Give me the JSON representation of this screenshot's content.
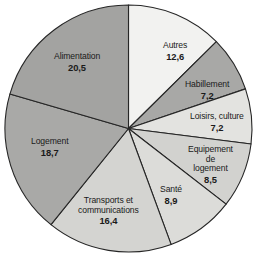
{
  "chart_data": {
    "type": "pie",
    "title": "",
    "subtitle": "",
    "xlabel": "",
    "ylabel": "",
    "grid": false,
    "legend_position": "none",
    "label_format": "name + value inside slice",
    "decimal_separator": ",",
    "total": 100,
    "start_angle_deg": 0,
    "direction": "clockwise",
    "categories": [
      "Autres",
      "Habillement",
      "Loisirs, culture",
      "Equipement de logement",
      "Santé",
      "Transports et communications",
      "Logement",
      "Alimentation"
    ],
    "values": [
      12.6,
      7.2,
      7.2,
      8.5,
      8.9,
      16.4,
      18.7,
      20.5
    ],
    "slices": [
      {
        "name": "Autres",
        "label_lines": [
          "Autres"
        ],
        "value": 12.6,
        "value_text": "12,6",
        "color": "#f2f2f0",
        "start_deg": 0,
        "end_deg": 45.36
      },
      {
        "name": "Habillement",
        "label_lines": [
          "Habillement"
        ],
        "value": 7.2,
        "value_text": "7,2",
        "color": "#a8a8a6",
        "start_deg": 45.36,
        "end_deg": 71.28
      },
      {
        "name": "Loisirs, culture",
        "label_lines": [
          "Loisirs, culture"
        ],
        "value": 7.2,
        "value_text": "7,2",
        "color": "#e3e3e0",
        "start_deg": 71.28,
        "end_deg": 97.2
      },
      {
        "name": "Equipement de logement",
        "label_lines": [
          "Equipement",
          "de",
          "logement"
        ],
        "value": 8.5,
        "value_text": "8,5",
        "color": "#d2d2cf",
        "start_deg": 97.2,
        "end_deg": 127.8
      },
      {
        "name": "Santé",
        "label_lines": [
          "Santé"
        ],
        "value": 8.9,
        "value_text": "8,9",
        "color": "#dcdcd9",
        "start_deg": 127.8,
        "end_deg": 159.84
      },
      {
        "name": "Transports et communications",
        "label_lines": [
          "Transports et",
          "communications"
        ],
        "value": 16.4,
        "value_text": "16,4",
        "color": "#d4d4d1",
        "start_deg": 159.84,
        "end_deg": 218.88
      },
      {
        "name": "Logement",
        "label_lines": [
          "Logement"
        ],
        "value": 18.7,
        "value_text": "18,7",
        "color": "#a9a9a7",
        "start_deg": 218.88,
        "end_deg": 286.2
      },
      {
        "name": "Alimentation",
        "label_lines": [
          "Alimentation"
        ],
        "value": 20.5,
        "value_text": "20,5",
        "color": "#a3a3a1",
        "start_deg": 286.2,
        "end_deg": 360
      }
    ],
    "geometry": {
      "center_x": 128.5,
      "center_y": 128.5,
      "radius": 123.5
    },
    "style": {
      "stroke_color": "#262626",
      "stroke_width": 1.1,
      "background": "#ffffff",
      "label_color": "#1a1a1a"
    }
  },
  "labels": {
    "autres": {
      "name": "Autres",
      "value": "12,6",
      "x": 163,
      "y": 41
    },
    "habillement": {
      "name": "Habillement",
      "value": "7,2",
      "x": 185,
      "y": 80
    },
    "loisirs": {
      "name": "Loisirs, culture",
      "value": "7,2",
      "x": 190,
      "y": 112
    },
    "equipement": {
      "name_l1": "Equipement",
      "name_l2": "de",
      "name_l3": "logement",
      "value": "8,5",
      "x": 188,
      "y": 145
    },
    "sante": {
      "name": "Santé",
      "value": "8,9",
      "x": 160,
      "y": 185
    },
    "transports": {
      "name_l1": "Transports et",
      "name_l2": "communications",
      "value": "16,4",
      "x": 78,
      "y": 196
    },
    "logement": {
      "name": "Logement",
      "value": "18,7",
      "x": 31,
      "y": 137
    },
    "alimentation": {
      "name": "Alimentation",
      "value": "20,5",
      "x": 54,
      "y": 52
    }
  }
}
